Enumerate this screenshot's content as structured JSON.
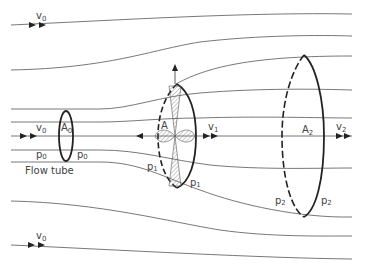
{
  "diagram": {
    "type": "actuator disk flow tube (momentum theory)",
    "caption": "Flow tube",
    "colors": {
      "stroke": "#333333",
      "text": "#444444",
      "background": "#ffffff"
    },
    "labels": {
      "v0_top": {
        "main": "v",
        "sub": "0"
      },
      "v0_mid": {
        "main": "v",
        "sub": "0"
      },
      "v0_bottom": {
        "main": "v",
        "sub": "0"
      },
      "A0": {
        "main": "A",
        "sub": "0"
      },
      "p0_left": {
        "main": "p",
        "sub": "0"
      },
      "p0_right": {
        "main": "p",
        "sub": "0"
      },
      "A": {
        "main": "A"
      },
      "v1": {
        "main": "v",
        "sub": "1"
      },
      "p1_left": {
        "main": "p",
        "sub": "1"
      },
      "p1_right": {
        "main": "p",
        "sub": "1"
      },
      "A2": {
        "main": "A",
        "sub": "2"
      },
      "v2": {
        "main": "v",
        "sub": "2"
      },
      "p2_left": {
        "main": "p",
        "sub": "2"
      },
      "p2_right": {
        "main": "p",
        "sub": "2"
      }
    },
    "sections": [
      {
        "name": "inlet",
        "area": "A0",
        "velocity": "v0",
        "pressure": "p0"
      },
      {
        "name": "rotor-disk",
        "area": "A",
        "velocity": "v1",
        "pressure": "p1"
      },
      {
        "name": "wake",
        "area": "A2",
        "velocity": "v2",
        "pressure": "p2"
      }
    ]
  }
}
